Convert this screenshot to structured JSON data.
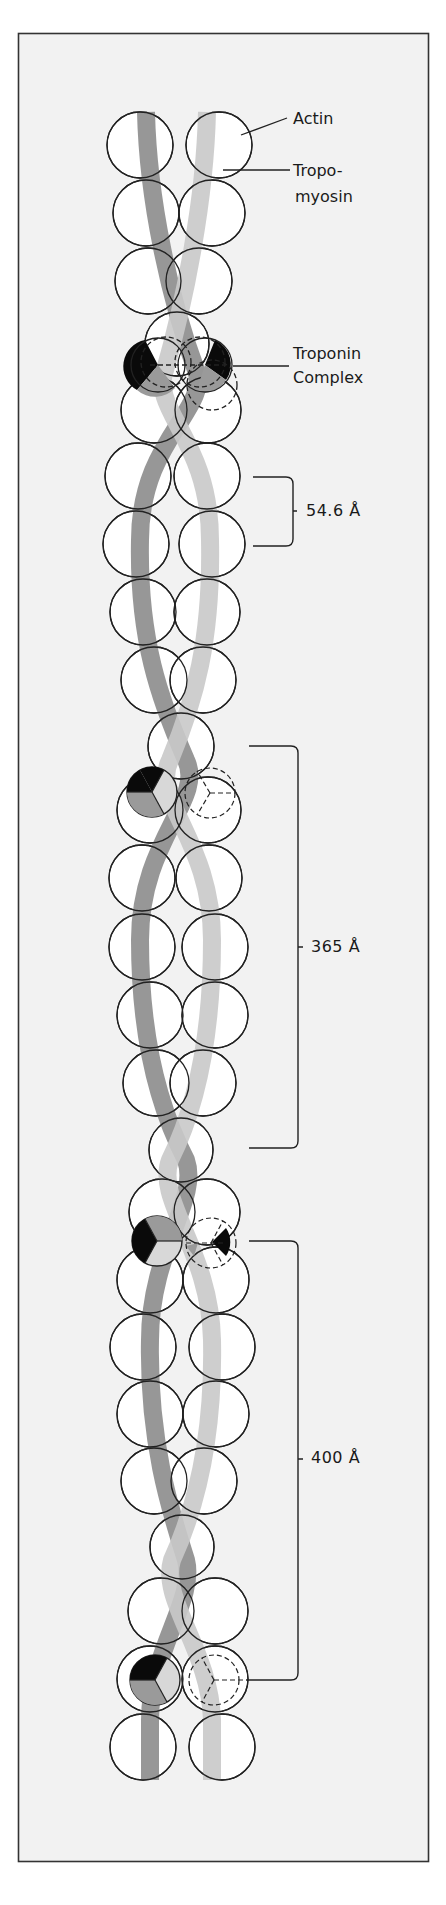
{
  "figure": {
    "colors": {
      "background": "#f2f2f2",
      "frame": "#333333",
      "actin_fill": "#ffffff",
      "actin_stroke": "#222222",
      "tropomyosin_dark": "#8c8c8c",
      "tropomyosin_light": "#cdcdcd",
      "troponin_black": "#0a0a0a",
      "troponin_gray": "#9a9a9a",
      "troponin_light": "#d8d8d8"
    }
  },
  "labels": {
    "actin": "Actin",
    "tropomyosin_line1": "Tropo-",
    "tropomyosin_line2": "myosin",
    "troponin_line1": "Troponin",
    "troponin_line2": "Complex"
  },
  "measurements": {
    "monomer_spacing": "54.6 Å",
    "half_pitch": "365 Å",
    "troponin_spacing": "400 Å"
  }
}
